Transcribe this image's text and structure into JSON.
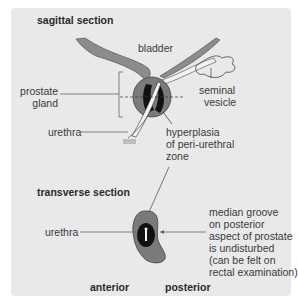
{
  "sagittal": {
    "title": "sagittal section",
    "labels": {
      "bladder": "bladder",
      "prostate_line1": "prostate",
      "prostate_line2": "gland",
      "seminal_line1": "seminal",
      "seminal_line2": "vesicle",
      "urethra": "urethra",
      "hyperplasia_line1": "hyperplasia",
      "hyperplasia_line2": "of peri-urethral",
      "hyperplasia_line3": "zone"
    }
  },
  "transverse": {
    "title": "transverse section",
    "labels": {
      "urethra": "urethra",
      "groove_line1": "median groove",
      "groove_line2": "on posterior",
      "groove_line3": "aspect of prostate",
      "groove_line4": "is undisturbed",
      "groove_line5": "(can be felt on",
      "groove_line6": "rectal examination)",
      "anterior": "anterior",
      "posterior": "posterior"
    }
  },
  "colors": {
    "panel_bg": "#e9e9e9",
    "prostate_outer": "#7a7a7a",
    "hyperplasia": "#111111",
    "bladder_wall": "#8c8c8c"
  }
}
